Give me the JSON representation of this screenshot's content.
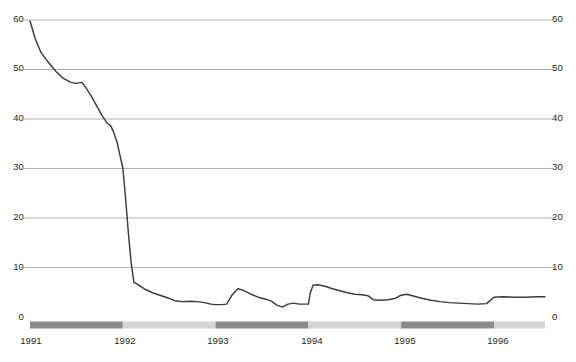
{
  "chart_data": {
    "type": "line",
    "title": "",
    "subtitle": "",
    "xlabel": "",
    "ylabel": "",
    "xlim": [
      1991.0,
      1996.55
    ],
    "ylim": [
      0,
      60
    ],
    "grid": true,
    "legend": "none",
    "y_ticks": [
      0,
      10,
      20,
      30,
      40,
      50,
      60
    ],
    "y_tick_labels_left": [
      "0",
      "10",
      "20",
      "30",
      "40",
      "50",
      "60"
    ],
    "y_tick_labels_right": [
      "0",
      "10",
      "20",
      "30",
      "40",
      "50",
      "60"
    ],
    "x_ticks": [
      1991,
      1992,
      1993,
      1994,
      1995,
      1996
    ],
    "x_tick_labels": [
      "1991",
      "1992",
      "1993",
      "1994",
      "1995",
      "1996"
    ],
    "series": [
      {
        "name": "series-1",
        "color": "#3b3b3b",
        "points": [
          [
            1991.0,
            59.8
          ],
          [
            1991.06,
            56.0
          ],
          [
            1991.12,
            53.4
          ],
          [
            1991.2,
            51.4
          ],
          [
            1991.28,
            49.6
          ],
          [
            1991.36,
            48.2
          ],
          [
            1991.44,
            47.4
          ],
          [
            1991.5,
            47.2
          ],
          [
            1991.56,
            47.4
          ],
          [
            1991.6,
            46.4
          ],
          [
            1991.66,
            44.6
          ],
          [
            1991.72,
            42.6
          ],
          [
            1991.78,
            40.6
          ],
          [
            1991.83,
            39.2
          ],
          [
            1991.87,
            38.6
          ],
          [
            1991.9,
            37.4
          ],
          [
            1991.94,
            35.2
          ],
          [
            1991.97,
            32.6
          ],
          [
            1992.0,
            30.2
          ],
          [
            1992.03,
            24.0
          ],
          [
            1992.06,
            17.0
          ],
          [
            1992.09,
            11.0
          ],
          [
            1992.12,
            7.0
          ],
          [
            1992.16,
            6.6
          ],
          [
            1992.24,
            5.6
          ],
          [
            1992.32,
            4.9
          ],
          [
            1992.4,
            4.4
          ],
          [
            1992.48,
            3.9
          ],
          [
            1992.56,
            3.3
          ],
          [
            1992.64,
            3.1
          ],
          [
            1992.72,
            3.2
          ],
          [
            1992.8,
            3.1
          ],
          [
            1992.88,
            2.9
          ],
          [
            1992.95,
            2.6
          ],
          [
            1993.0,
            2.5
          ],
          [
            1993.06,
            2.5
          ],
          [
            1993.12,
            2.6
          ],
          [
            1993.18,
            4.5
          ],
          [
            1993.24,
            5.7
          ],
          [
            1993.3,
            5.4
          ],
          [
            1993.38,
            4.6
          ],
          [
            1993.46,
            4.0
          ],
          [
            1993.54,
            3.6
          ],
          [
            1993.6,
            3.2
          ],
          [
            1993.66,
            2.4
          ],
          [
            1993.72,
            2.0
          ],
          [
            1993.78,
            2.6
          ],
          [
            1993.84,
            2.8
          ],
          [
            1993.9,
            2.6
          ],
          [
            1993.95,
            2.6
          ],
          [
            1994.0,
            2.6
          ],
          [
            1994.02,
            4.8
          ],
          [
            1994.05,
            6.4
          ],
          [
            1994.1,
            6.5
          ],
          [
            1994.18,
            6.2
          ],
          [
            1994.26,
            5.7
          ],
          [
            1994.34,
            5.3
          ],
          [
            1994.42,
            4.9
          ],
          [
            1994.5,
            4.6
          ],
          [
            1994.58,
            4.5
          ],
          [
            1994.64,
            4.3
          ],
          [
            1994.7,
            3.5
          ],
          [
            1994.78,
            3.4
          ],
          [
            1994.86,
            3.5
          ],
          [
            1994.94,
            3.8
          ],
          [
            1995.0,
            4.4
          ],
          [
            1995.06,
            4.6
          ],
          [
            1995.12,
            4.3
          ],
          [
            1995.22,
            3.8
          ],
          [
            1995.32,
            3.4
          ],
          [
            1995.42,
            3.1
          ],
          [
            1995.52,
            2.9
          ],
          [
            1995.62,
            2.8
          ],
          [
            1995.72,
            2.7
          ],
          [
            1995.82,
            2.6
          ],
          [
            1995.92,
            2.7
          ],
          [
            1996.0,
            4.0
          ],
          [
            1996.1,
            4.1
          ],
          [
            1996.22,
            4.0
          ],
          [
            1996.34,
            4.0
          ],
          [
            1996.46,
            4.1
          ],
          [
            1996.55,
            4.1
          ]
        ]
      }
    ],
    "period_bar": {
      "track_color": "#d4d4d4",
      "highlight_color": "#8a8a8a",
      "segments": [
        {
          "name": "segment-1991",
          "start": 1991.0,
          "end": 1992.0,
          "highlighted": true
        },
        {
          "name": "segment-1992",
          "start": 1992.0,
          "end": 1993.0,
          "highlighted": false
        },
        {
          "name": "segment-1993",
          "start": 1993.0,
          "end": 1994.0,
          "highlighted": true
        },
        {
          "name": "segment-1994",
          "start": 1994.0,
          "end": 1995.0,
          "highlighted": false
        },
        {
          "name": "segment-1995",
          "start": 1995.0,
          "end": 1996.0,
          "highlighted": true
        },
        {
          "name": "segment-1996",
          "start": 1996.0,
          "end": 1996.55,
          "highlighted": false
        }
      ]
    },
    "colors": {
      "line": "#3b3b3b",
      "grid": "#a8a8a8",
      "axis_text": "#231f20",
      "background": "#ffffff",
      "bar_highlight": "#8a8a8a",
      "bar_track": "#d4d4d4"
    }
  }
}
